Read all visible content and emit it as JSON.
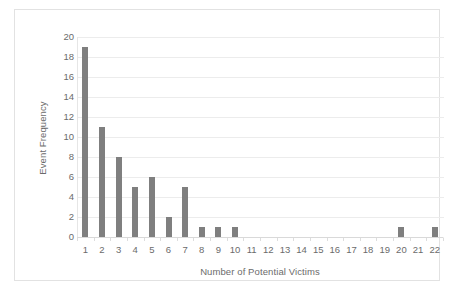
{
  "chart_data": {
    "type": "bar",
    "title": "",
    "xlabel": "Number of Potential Victims",
    "ylabel": "Event Frequency",
    "categories": [
      "1",
      "2",
      "3",
      "4",
      "5",
      "6",
      "7",
      "8",
      "9",
      "10",
      "11",
      "12",
      "13",
      "14",
      "15",
      "16",
      "17",
      "18",
      "19",
      "20",
      "21",
      "22"
    ],
    "values": [
      19,
      11,
      8,
      5,
      6,
      2,
      5,
      1,
      1,
      1,
      0,
      0,
      0,
      0,
      0,
      0,
      0,
      0,
      0,
      1,
      0,
      1
    ],
    "ylim": [
      0,
      20
    ],
    "y_ticks": [
      "0",
      "2",
      "4",
      "6",
      "8",
      "10",
      "12",
      "14",
      "16",
      "18",
      "20"
    ],
    "grid": true,
    "legend": "none",
    "bar_color": "#7f7f7f",
    "gridline_color": "#ececec",
    "text_color": "#6b6b6b",
    "frame_color": "#e2e2e2",
    "background": "#ffffff"
  }
}
